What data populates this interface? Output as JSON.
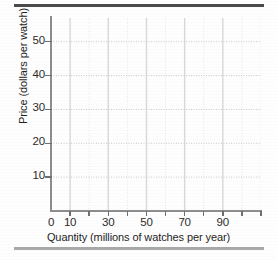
{
  "chart_data": {
    "type": "scatter",
    "title": "",
    "subtitle": "",
    "xlabel": "Quantity (millions of watches per year)",
    "ylabel": "Price (dollars per watch)",
    "xlim": [
      0,
      110
    ],
    "ylim": [
      0,
      57
    ],
    "grid": true,
    "legend": null,
    "series": [
      {
        "name": "",
        "x": [],
        "y": []
      }
    ],
    "annotations": [],
    "x_major_ticks": [
      0,
      10,
      20,
      30,
      40,
      50,
      60,
      70,
      80,
      90,
      100,
      110
    ],
    "x_tick_labels": [
      "0",
      "10",
      "",
      "30",
      "",
      "50",
      "",
      "70",
      "",
      "90",
      "",
      ""
    ],
    "y_major_ticks": [
      10,
      20,
      30,
      40,
      50
    ],
    "y_tick_labels": [
      "10",
      "20",
      "30",
      "40",
      "50"
    ],
    "note": "Blank graph template with no plotted data points"
  },
  "axes": {
    "y_labels": [
      {
        "value": 50,
        "text": "50"
      },
      {
        "value": 40,
        "text": "40"
      },
      {
        "value": 30,
        "text": "30"
      },
      {
        "value": 20,
        "text": "20"
      },
      {
        "value": 10,
        "text": "10"
      }
    ],
    "x_labels": [
      {
        "value": 0,
        "text": "0"
      },
      {
        "value": 10,
        "text": "10"
      },
      {
        "value": 30,
        "text": "30"
      },
      {
        "value": 50,
        "text": "50"
      },
      {
        "value": 70,
        "text": "70"
      },
      {
        "value": 90,
        "text": "90"
      }
    ],
    "y_title": "Price (dollars per watch)",
    "x_title": "Quantity (millions of watches per year)"
  },
  "style": {
    "axis_color": "#8d8d8d",
    "grid_color": "#d8d8d8",
    "grid_minor_color": "#e6e6e6",
    "text_color": "#1f1f1f",
    "rule_top_color": "#4a4a4a",
    "rule_bottom_color": "#a9a9a9",
    "background": "#fefefe"
  }
}
